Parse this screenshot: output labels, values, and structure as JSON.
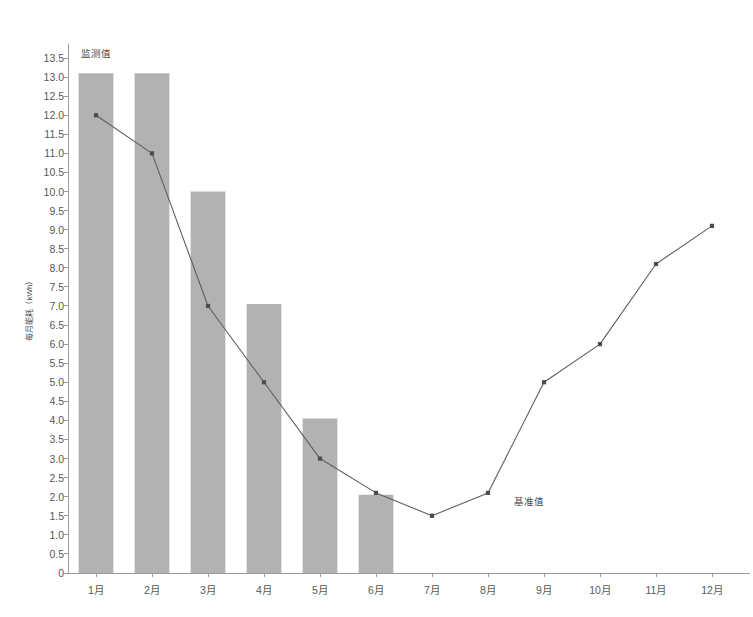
{
  "chart_data": {
    "type": "bar",
    "title": "",
    "xlabel": "",
    "ylabel": "每月能耗（kWh）",
    "ylim": [
      0,
      13.5
    ],
    "grid": false,
    "legend_position": "none",
    "categories": [
      "1月",
      "2月",
      "3月",
      "4月",
      "5月",
      "6月",
      "7月",
      "8月",
      "9月",
      "10月",
      "11月",
      "12月"
    ],
    "ytick_labels": [
      "0",
      "0.5",
      "1.0",
      "1.5",
      "2.0",
      "2.5",
      "3.0",
      "3.5",
      "4.0",
      "4.5",
      "5.0",
      "5.5",
      "6.0",
      "6.5",
      "7.0",
      "7.5",
      "8.0",
      "8.5",
      "9.0",
      "9.5",
      "10.0",
      "10.5",
      "11.0",
      "11.5",
      "12.0",
      "12.5",
      "13.0",
      "13.5"
    ],
    "ytick_values": [
      0,
      0.5,
      1.0,
      1.5,
      2.0,
      2.5,
      3.0,
      3.5,
      4.0,
      4.5,
      5.0,
      5.5,
      6.0,
      6.5,
      7.0,
      7.5,
      8.0,
      8.5,
      9.0,
      9.5,
      10.0,
      10.5,
      11.0,
      11.5,
      12.0,
      12.5,
      13.0,
      13.5
    ],
    "series": [
      {
        "name": "监测值",
        "render": "bar",
        "color": "#b2b2b2",
        "values": [
          13.1,
          13.1,
          10.0,
          7.05,
          4.05,
          2.05,
          null,
          null,
          null,
          null,
          null,
          null
        ]
      },
      {
        "name": "基准值",
        "render": "line",
        "color": "#5e5e5e",
        "marker": "square",
        "values": [
          12.0,
          11.0,
          7.0,
          5.0,
          3.0,
          2.1,
          1.5,
          2.1,
          5.0,
          6.0,
          8.1,
          9.1
        ]
      }
    ],
    "annotations": [
      {
        "text": "监测值",
        "x_category": "1月",
        "y": 13.6,
        "align": "center"
      },
      {
        "text": "基准值",
        "x_category": "8月",
        "y": 1.85,
        "align": "left"
      }
    ]
  },
  "colors": {
    "bar": "#b2b2b2",
    "line": "#5e5e5e",
    "marker": "#4d4d4d",
    "axis": "#9a9a9a",
    "tick_text": "#55595c",
    "background": "#ffffff"
  }
}
